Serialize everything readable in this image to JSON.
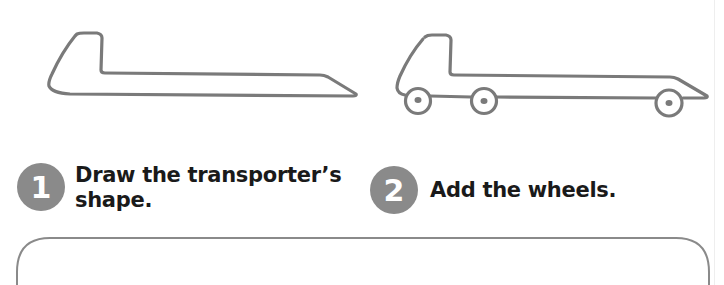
{
  "steps": [
    {
      "number": "1",
      "text_line1": "Draw the transporter’s",
      "text_line2": "shape."
    },
    {
      "number": "2",
      "text": "Add the wheels."
    }
  ],
  "drawings": [
    {
      "label": "transporter-outline",
      "wheels": 0
    },
    {
      "label": "transporter-with-wheels",
      "wheels": 3
    }
  ],
  "colors": {
    "stroke": "#7a7a7a",
    "badge": "#8a8a8a",
    "text": "#1a1a1a",
    "box_border": "#8a8a8a"
  }
}
